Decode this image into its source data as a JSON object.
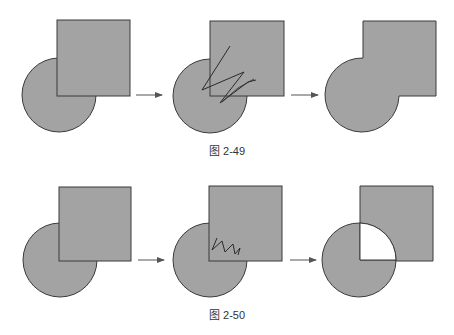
{
  "colors": {
    "shape_fill": "#a3a3a3",
    "shape_stroke": "#3a3a3a",
    "hole_fill": "#ffffff",
    "arrow": "#555555",
    "scribble": "#2a2a2a"
  },
  "figures": [
    {
      "caption": "图 2-49",
      "steps": [
        {
          "name": "square-over-circle",
          "description": "Square overlapping circle"
        },
        {
          "name": "scribble-across-overlap",
          "description": "Scribble gesture drawn across shapes"
        },
        {
          "name": "union-result",
          "description": "Shapes merged into single outline"
        }
      ]
    },
    {
      "caption": "图 2-50",
      "steps": [
        {
          "name": "square-over-circle",
          "description": "Square overlapping circle"
        },
        {
          "name": "scribble-in-overlap",
          "description": "Zigzag scribble inside overlap region"
        },
        {
          "name": "overlap-removed",
          "description": "Overlap region removed (exclusion)"
        }
      ]
    }
  ]
}
